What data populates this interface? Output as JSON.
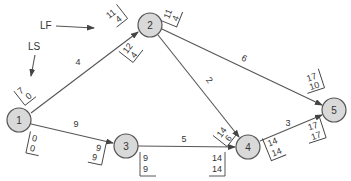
{
  "annotations": {
    "lf": "LF",
    "ls": "LS"
  },
  "nodes": [
    {
      "id": "1",
      "x": 19,
      "y": 120
    },
    {
      "id": "2",
      "x": 150,
      "y": 25
    },
    {
      "id": "3",
      "x": 126,
      "y": 146
    },
    {
      "id": "4",
      "x": 248,
      "y": 147
    },
    {
      "id": "5",
      "x": 334,
      "y": 110
    }
  ],
  "edges": [
    {
      "from": "1",
      "to": "2",
      "duration": "4"
    },
    {
      "from": "1",
      "to": "3",
      "duration": "9"
    },
    {
      "from": "2",
      "to": "4",
      "duration": "2"
    },
    {
      "from": "2",
      "to": "5",
      "duration": "6"
    },
    {
      "from": "3",
      "to": "4",
      "duration": "5"
    },
    {
      "from": "4",
      "to": "5",
      "duration": "3"
    }
  ],
  "time_boxes": {
    "e12_end": {
      "top": "11",
      "bottom": "4"
    },
    "e12_start": {
      "top": "7",
      "bottom": "0"
    },
    "e13_start": {
      "top": "0",
      "bottom": "0"
    },
    "e13_end": {
      "top": "9",
      "bottom": "9"
    },
    "e24_start": {
      "top": "12",
      "bottom": "4"
    },
    "e25_start": {
      "top": "11",
      "bottom": "4"
    },
    "e24_end": {
      "top": "14",
      "bottom": "6"
    },
    "e34_start": {
      "top": "9",
      "bottom": "9"
    },
    "e34_end": {
      "top": "14",
      "bottom": "14"
    },
    "e45_start": {
      "top": "14",
      "bottom": "14"
    },
    "e25_end": {
      "top": "17",
      "bottom": "10"
    },
    "e45_end": {
      "top": "17",
      "bottom": "17"
    }
  },
  "colors": {
    "node_fill": "#d9d9d9",
    "line": "#555555",
    "text": "#333333"
  }
}
